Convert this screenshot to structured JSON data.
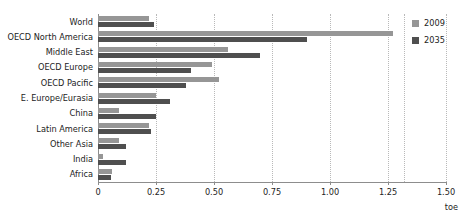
{
  "chart_data": {
    "type": "bar",
    "orientation": "horizontal",
    "title": "",
    "xlabel": "toe",
    "ylabel": "",
    "xlim": [
      0,
      1.5
    ],
    "xticks": [
      "0",
      "0.25",
      "0.50",
      "0.75",
      "1.00",
      "1.25",
      "1.50"
    ],
    "xtick_values": [
      0,
      0.25,
      0.5,
      0.75,
      1.0,
      1.25,
      1.5
    ],
    "grid": true,
    "legend_position": "right",
    "categories": [
      "World",
      "OECD North America",
      "Middle East",
      "OECD Europe",
      "OECD Pacific",
      "E. Europe/Eurasia",
      "China",
      "Latin America",
      "Other Asia",
      "India",
      "Africa"
    ],
    "series": [
      {
        "name": "2009",
        "color": "#969696",
        "values": [
          0.22,
          1.27,
          0.56,
          0.49,
          0.52,
          0.25,
          0.09,
          0.22,
          0.09,
          0.02,
          0.06
        ]
      },
      {
        "name": "2035",
        "color": "#4f4f4f",
        "values": [
          0.24,
          0.9,
          0.7,
          0.4,
          0.38,
          0.31,
          0.25,
          0.23,
          0.12,
          0.12,
          0.055
        ]
      }
    ]
  },
  "legend": {
    "items": [
      {
        "label": "2009",
        "color": "#969696"
      },
      {
        "label": "2035",
        "color": "#4f4f4f"
      }
    ]
  },
  "axis": {
    "unit_label": "toe"
  }
}
